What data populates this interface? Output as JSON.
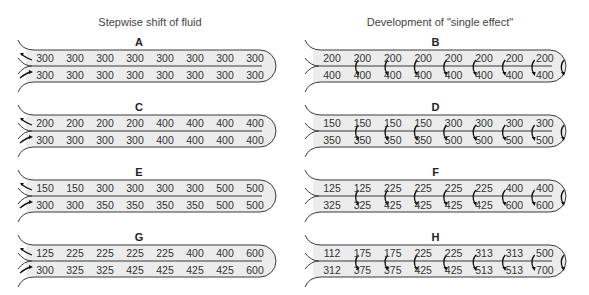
{
  "titles": {
    "left": "Stepwise shift of fluid",
    "right": "Development of \"single effect\""
  },
  "colors": {
    "tube_fill": "#ececec",
    "tube_stroke": "#3a3a3a",
    "text": "#333333"
  },
  "panels": [
    {
      "id": "A",
      "column": "left",
      "top": [
        300,
        300,
        300,
        300,
        300,
        300,
        300,
        300
      ],
      "bottom": [
        300,
        300,
        300,
        300,
        300,
        300,
        300,
        300
      ],
      "arrows": "flow"
    },
    {
      "id": "B",
      "column": "right",
      "top": [
        200,
        200,
        200,
        200,
        200,
        200,
        200,
        200
      ],
      "bottom": [
        400,
        400,
        400,
        400,
        400,
        400,
        400,
        400
      ],
      "arrows": "transfer"
    },
    {
      "id": "C",
      "column": "left",
      "top": [
        200,
        200,
        200,
        200,
        400,
        400,
        400,
        400
      ],
      "bottom": [
        300,
        300,
        300,
        300,
        400,
        400,
        400,
        400
      ],
      "arrows": "flow"
    },
    {
      "id": "D",
      "column": "right",
      "top": [
        150,
        150,
        150,
        150,
        300,
        300,
        300,
        300
      ],
      "bottom": [
        350,
        350,
        350,
        350,
        500,
        500,
        500,
        500
      ],
      "arrows": "transfer"
    },
    {
      "id": "E",
      "column": "left",
      "top": [
        150,
        150,
        300,
        300,
        300,
        300,
        500,
        500
      ],
      "bottom": [
        300,
        300,
        350,
        350,
        350,
        350,
        500,
        500
      ],
      "arrows": "flow"
    },
    {
      "id": "F",
      "column": "right",
      "top": [
        125,
        125,
        225,
        225,
        225,
        225,
        400,
        400
      ],
      "bottom": [
        325,
        325,
        425,
        425,
        425,
        425,
        600,
        600
      ],
      "arrows": "transfer"
    },
    {
      "id": "G",
      "column": "left",
      "top": [
        125,
        225,
        225,
        225,
        225,
        400,
        400,
        600
      ],
      "bottom": [
        300,
        325,
        325,
        425,
        425,
        425,
        425,
        600
      ],
      "arrows": "flow"
    },
    {
      "id": "H",
      "column": "right",
      "top": [
        112,
        175,
        175,
        225,
        225,
        313,
        313,
        500
      ],
      "bottom": [
        312,
        375,
        375,
        425,
        425,
        513,
        513,
        700
      ],
      "arrows": "transfer"
    }
  ]
}
